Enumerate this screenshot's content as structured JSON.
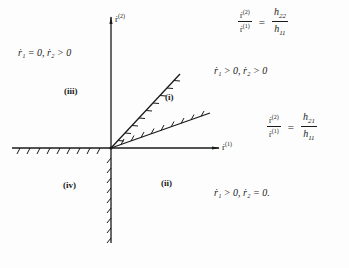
{
  "diagram": {
    "type": "phase-plane-region-diagram",
    "axes": {
      "x_label_base": "ṙ",
      "x_label_sup": "(1)",
      "y_label_base": "ṙ",
      "y_label_sup": "(2)"
    },
    "regions": [
      {
        "id": "i",
        "label": "(i)"
      },
      {
        "id": "ii",
        "label": "(ii)"
      },
      {
        "id": "iii",
        "label": "(iii)"
      },
      {
        "id": "iv",
        "label": "(iv)"
      }
    ],
    "conditions": {
      "region_iii": "ṙ₁ = 0,  ṙ₂ > 0",
      "region_i": "ṙ₁ > 0,  ṙ₂ > 0",
      "region_ii": "ṙ₁ > 0,  ṙ₂ = 0."
    },
    "ratio_upper": {
      "lhs_num_base": "ṙ",
      "lhs_num_sup": "(2)",
      "lhs_den_base": "ṙ",
      "lhs_den_sup": "(1)",
      "eq": "=",
      "rhs_num": "h22",
      "rhs_den": "h11"
    },
    "ratio_lower": {
      "lhs_num_base": "ṙ",
      "lhs_num_sup": "(2)",
      "lhs_den_base": "ṙ",
      "lhs_den_sup": "(1)",
      "eq": "=",
      "rhs_num": "h21",
      "rhs_den": "h11"
    },
    "colors": {
      "ink": "#1a1a1a",
      "background": "#fdfdfd"
    }
  }
}
